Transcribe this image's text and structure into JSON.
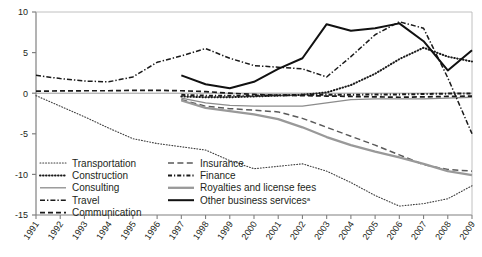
{
  "chart_data": {
    "type": "line",
    "title": "",
    "subtitle": "",
    "xlabel": "",
    "ylabel": "",
    "xlim": [
      1991,
      2009
    ],
    "ylim": [
      -15,
      10
    ],
    "yticks": [
      10,
      5,
      0,
      -5,
      -10,
      -15
    ],
    "ytick_labels": [
      "10",
      "5",
      "0",
      "-5",
      "-10",
      "-15"
    ],
    "x": [
      1991,
      1992,
      1993,
      1994,
      1995,
      1996,
      1997,
      1998,
      1999,
      2000,
      2001,
      2002,
      2003,
      2004,
      2005,
      2006,
      2007,
      2008,
      2009
    ],
    "xtick_labels": [
      "1991",
      "1992",
      "1993",
      "1994",
      "1995",
      "1996",
      "1997",
      "1998",
      "1999",
      "2000",
      "2001",
      "2002",
      "2003",
      "2004",
      "2005",
      "2006",
      "2007",
      "2008",
      "2009"
    ],
    "grid": false,
    "legend_position": "inside-lower-left",
    "zero_line": true,
    "series": [
      {
        "name": "Transportation",
        "style": "dotted-fine",
        "color": "#3f3f3f",
        "x": [
          1991,
          1992,
          1993,
          1994,
          1995,
          1996,
          1997,
          1998,
          1999,
          2000,
          2001,
          2002,
          2003,
          2004,
          2005,
          2006,
          2007,
          2008,
          2009
        ],
        "values": [
          -0.3,
          -1.6,
          -2.9,
          -4.3,
          -5.6,
          -6.2,
          -6.6,
          -7.0,
          -8.3,
          -9.3,
          -9.0,
          -8.7,
          -9.6,
          -11.0,
          -12.6,
          -13.9,
          -13.6,
          -13.0,
          -11.4
        ]
      },
      {
        "name": "Construction",
        "style": "dotted-bold",
        "color": "#1a1a1a",
        "x": [
          1997,
          1998,
          1999,
          2000,
          2001,
          2002,
          2003,
          2004,
          2005,
          2006,
          2007,
          2008,
          2009
        ],
        "values": [
          -0.4,
          -0.5,
          -0.5,
          -0.4,
          -0.3,
          -0.2,
          0.1,
          1.0,
          2.4,
          4.2,
          5.6,
          4.5,
          3.9
        ]
      },
      {
        "name": "Consulting",
        "style": "solid-gray-thin",
        "color": "#8c8c8c",
        "x": [
          1997,
          1998,
          1999,
          2000,
          2001,
          2002,
          2003,
          2004,
          2005,
          2006,
          2007,
          2008,
          2009
        ],
        "values": [
          -0.6,
          -1.2,
          -1.5,
          -1.6,
          -1.6,
          -1.6,
          -1.2,
          -0.8,
          -0.7,
          -0.7,
          -0.7,
          -0.6,
          -0.5
        ]
      },
      {
        "name": "Travel",
        "style": "dashdot",
        "color": "#1a1a1a",
        "x": [
          1991,
          1992,
          1993,
          1994,
          1995,
          1996,
          1997,
          1998,
          1999,
          2000,
          2001,
          2002,
          2003,
          2004,
          2005,
          2006,
          2007,
          2008,
          2009
        ],
        "values": [
          2.2,
          1.8,
          1.5,
          1.4,
          2.0,
          3.8,
          4.6,
          5.5,
          4.3,
          3.4,
          3.2,
          3.0,
          2.0,
          4.5,
          7.2,
          8.8,
          8.0,
          1.9,
          -5.0
        ]
      },
      {
        "name": "Communication",
        "style": "dashed",
        "color": "#1a1a1a",
        "x": [
          1991,
          1992,
          1993,
          1994,
          1995,
          1996,
          1997,
          1998,
          1999,
          2000,
          2001,
          2002,
          2003,
          2004,
          2005,
          2006,
          2007,
          2008,
          2009
        ],
        "values": [
          0.25,
          0.28,
          0.3,
          0.3,
          0.35,
          0.35,
          0.3,
          0.2,
          0.0,
          -0.15,
          -0.25,
          -0.3,
          -0.35,
          -0.4,
          -0.45,
          -0.5,
          -0.45,
          -0.4,
          -0.35
        ]
      },
      {
        "name": "Insurance",
        "style": "dashed-long",
        "color": "#5a5a5a",
        "x": [
          1997,
          1998,
          1999,
          2000,
          2001,
          2002,
          2003,
          2004,
          2005,
          2006,
          2007,
          2008,
          2009
        ],
        "values": [
          -0.8,
          -1.6,
          -1.9,
          -2.1,
          -2.3,
          -3.1,
          -4.2,
          -5.3,
          -6.4,
          -7.6,
          -8.8,
          -9.4,
          -9.6
        ]
      },
      {
        "name": "Finance",
        "style": "dashdot-bold",
        "color": "#1a1a1a",
        "x": [
          1997,
          1998,
          1999,
          2000,
          2001,
          2002,
          2003,
          2004,
          2005,
          2006,
          2007,
          2008,
          2009
        ],
        "values": [
          -0.2,
          -0.3,
          -0.3,
          -0.3,
          -0.25,
          -0.2,
          -0.2,
          -0.2,
          -0.15,
          -0.15,
          -0.1,
          -0.05,
          -0.05
        ]
      },
      {
        "name": "Royalties and license fees",
        "style": "solid-gray-thick",
        "color": "#999999",
        "x": [
          1997,
          1998,
          1999,
          2000,
          2001,
          2002,
          2003,
          2004,
          2005,
          2006,
          2007,
          2008,
          2009
        ],
        "values": [
          -0.9,
          -1.8,
          -2.2,
          -2.6,
          -3.2,
          -4.2,
          -5.4,
          -6.4,
          -7.2,
          -7.9,
          -8.7,
          -9.6,
          -10.1
        ]
      },
      {
        "name": "Other business services",
        "style": "solid-black-thick",
        "color": "#111111",
        "superscript": "a",
        "x": [
          1997,
          1998,
          1999,
          2000,
          2001,
          2002,
          2003,
          2004,
          2005,
          2006,
          2007,
          2008,
          2009
        ],
        "values": [
          2.2,
          1.1,
          0.6,
          1.4,
          3.0,
          4.3,
          8.5,
          7.7,
          8.0,
          8.6,
          6.4,
          2.8,
          5.3
        ]
      }
    ],
    "legend": {
      "column1": [
        {
          "label": "Transportation",
          "style": "dotted-fine",
          "color": "#3f3f3f"
        },
        {
          "label": "Construction",
          "style": "dotted-bold",
          "color": "#1a1a1a"
        },
        {
          "label": "Consulting",
          "style": "solid-gray-thin",
          "color": "#8c8c8c"
        },
        {
          "label": "Travel",
          "style": "dashdot",
          "color": "#1a1a1a"
        },
        {
          "label": "Communication",
          "style": "dashed",
          "color": "#1a1a1a"
        }
      ],
      "column2": [
        {
          "label": "Insurance",
          "style": "dashed-long",
          "color": "#5a5a5a"
        },
        {
          "label": "Finance",
          "style": "dashdot-bold",
          "color": "#1a1a1a"
        },
        {
          "label": "Royalties and license fees",
          "style": "solid-gray-thick",
          "color": "#999999"
        },
        {
          "label": "Other business services",
          "style": "solid-black-thick",
          "color": "#111111",
          "superscript": "a"
        }
      ]
    },
    "colors": {
      "axis": "#808080",
      "zero_line": "#808080",
      "text": "#231f20",
      "gray_series": "#999999",
      "black_series": "#1a1a1a"
    }
  }
}
